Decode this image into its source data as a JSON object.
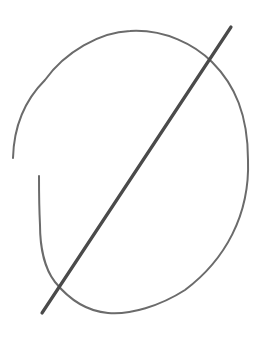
{
  "image": {
    "description": "Hand-drawn sketch of an empty-set / null symbol: an open oval with a diagonal slash",
    "symbol": "empty-set",
    "background": "#ffffff",
    "stroke_colors": {
      "oval": "#6b6b6b",
      "slash": "#4a4a4a"
    },
    "shapes": {
      "oval_path": "M13,158 C14,120 30,95 45,80 C65,52 100,32 130,31 C165,29 195,45 212,62 C235,85 248,115 248,160 C250,215 225,260 185,290 C160,306 130,315 108,313 C85,311 68,298 55,282 C44,268 40,245 40,225 C39,205 39,190 39,176",
      "slash_line": {
        "x1": 231,
        "y1": 27,
        "x2": 42,
        "y2": 313
      }
    }
  }
}
